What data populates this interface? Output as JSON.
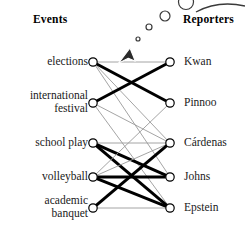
{
  "headers": {
    "left": "Events",
    "right": "Reporters"
  },
  "colors": {
    "node_stroke": "#000000",
    "node_fill": "#ffffff",
    "edge_strong": "#000000",
    "edge_weak": "#9a9a9a",
    "text": "#1a1a1a",
    "cursor": "#2b2b2b",
    "bubble_stroke": "#3a3a3a"
  },
  "chart_data": {
    "type": "diagram",
    "subtype": "bipartite-graph",
    "title": "",
    "left_axis_label": "Events",
    "right_axis_label": "Reporters",
    "left_nodes": [
      {
        "id": "elections",
        "label": "elections",
        "x": 93,
        "y": 62
      },
      {
        "id": "international_festival",
        "label": "international\nfestival",
        "x": 93,
        "y": 103
      },
      {
        "id": "school_play",
        "label": "school play",
        "x": 93,
        "y": 143
      },
      {
        "id": "volleyball",
        "label": "volleyball",
        "x": 93,
        "y": 177
      },
      {
        "id": "academic_banquet",
        "label": "academic\nbanquet",
        "x": 93,
        "y": 208
      }
    ],
    "right_nodes": [
      {
        "id": "kwan",
        "label": "Kwan",
        "x": 170,
        "y": 62
      },
      {
        "id": "pinnoo",
        "label": "Pinnoo",
        "x": 170,
        "y": 103
      },
      {
        "id": "cardenas",
        "label": "Cárdenas",
        "x": 170,
        "y": 143
      },
      {
        "id": "johns",
        "label": "Johns",
        "x": 170,
        "y": 177
      },
      {
        "id": "epstein",
        "label": "Epstein",
        "x": 170,
        "y": 208
      }
    ],
    "edges": [
      {
        "source": "elections",
        "target": "kwan",
        "weight": "weak"
      },
      {
        "source": "elections",
        "target": "pinnoo",
        "weight": "strong"
      },
      {
        "source": "elections",
        "target": "cardenas",
        "weight": "weak"
      },
      {
        "source": "elections",
        "target": "johns",
        "weight": "weak"
      },
      {
        "source": "international_festival",
        "target": "kwan",
        "weight": "strong"
      },
      {
        "source": "international_festival",
        "target": "cardenas",
        "weight": "weak"
      },
      {
        "source": "international_festival",
        "target": "epstein",
        "weight": "weak"
      },
      {
        "source": "school_play",
        "target": "cardenas",
        "weight": "weak"
      },
      {
        "source": "school_play",
        "target": "johns",
        "weight": "strong"
      },
      {
        "source": "school_play",
        "target": "epstein",
        "weight": "strong"
      },
      {
        "source": "volleyball",
        "target": "pinnoo",
        "weight": "weak"
      },
      {
        "source": "volleyball",
        "target": "cardenas",
        "weight": "weak"
      },
      {
        "source": "volleyball",
        "target": "johns",
        "weight": "strong"
      },
      {
        "source": "volleyball",
        "target": "epstein",
        "weight": "strong"
      },
      {
        "source": "academic_banquet",
        "target": "cardenas",
        "weight": "strong"
      },
      {
        "source": "academic_banquet",
        "target": "epstein",
        "weight": "weak"
      }
    ],
    "legend": [],
    "grid": false
  },
  "overlay": {
    "cursor": {
      "name": "arrow-cursor",
      "x": 130,
      "y": 48
    },
    "bubble_trail": [
      {
        "x": 138,
        "y": 39,
        "r": 2.0
      },
      {
        "x": 149,
        "y": 27,
        "r": 3.0
      },
      {
        "x": 165,
        "y": 16,
        "r": 5.0
      },
      {
        "x": 186,
        "y": 2,
        "r": 7.5
      }
    ],
    "callout_arc": {
      "name": "speech-bubble-arc"
    }
  }
}
